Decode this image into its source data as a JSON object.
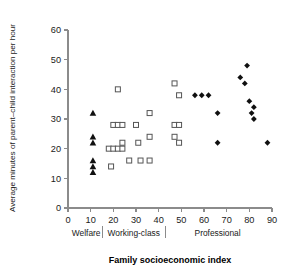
{
  "chart_data": {
    "type": "scatter",
    "title": "",
    "xlabel": "Family socioeconomic index",
    "ylabel": "Average minutes of parent–child interaction per hour",
    "xlim": [
      0,
      90
    ],
    "ylim": [
      0,
      60
    ],
    "xticks": [
      0,
      10,
      20,
      30,
      40,
      50,
      60,
      70,
      80,
      90
    ],
    "yticks": [
      0,
      10,
      20,
      30,
      40,
      50,
      60
    ],
    "xtick_labels": [
      "0",
      "10",
      "20",
      "30",
      "40",
      "50",
      "60",
      "70",
      "80",
      "90"
    ],
    "ytick_labels": [
      "0",
      "10",
      "20",
      "30",
      "40",
      "50",
      "60"
    ],
    "grid": false,
    "legend": "none",
    "category_bands": [
      {
        "label": "Welfare",
        "x_start": 0,
        "x_end": 15,
        "label_x": 8
      },
      {
        "label": "Working-class",
        "x_start": 15,
        "x_end": 43,
        "label_x": 29
      },
      {
        "label": "Professional",
        "x_start": 43,
        "x_end": 90,
        "label_x": 66
      }
    ],
    "band_separators": [
      15,
      43
    ],
    "series": [
      {
        "name": "Welfare",
        "marker": "triangle",
        "filled": true,
        "color": "#101010",
        "points": [
          {
            "x": 11,
            "y": 32
          },
          {
            "x": 11,
            "y": 24
          },
          {
            "x": 11,
            "y": 22
          },
          {
            "x": 11,
            "y": 16
          },
          {
            "x": 11,
            "y": 14
          },
          {
            "x": 11,
            "y": 12
          }
        ]
      },
      {
        "name": "Working-class",
        "marker": "square",
        "filled": false,
        "color": "#555555",
        "points": [
          {
            "x": 18,
            "y": 20
          },
          {
            "x": 19,
            "y": 14
          },
          {
            "x": 20,
            "y": 28
          },
          {
            "x": 20,
            "y": 20
          },
          {
            "x": 22,
            "y": 40
          },
          {
            "x": 22,
            "y": 28
          },
          {
            "x": 22,
            "y": 20
          },
          {
            "x": 24,
            "y": 28
          },
          {
            "x": 24,
            "y": 22
          },
          {
            "x": 24,
            "y": 20
          },
          {
            "x": 27,
            "y": 16
          },
          {
            "x": 30,
            "y": 28
          },
          {
            "x": 31,
            "y": 22
          },
          {
            "x": 32,
            "y": 16
          },
          {
            "x": 36,
            "y": 32
          },
          {
            "x": 36,
            "y": 24
          },
          {
            "x": 36,
            "y": 16
          },
          {
            "x": 47,
            "y": 42
          },
          {
            "x": 47,
            "y": 28
          },
          {
            "x": 47,
            "y": 24
          },
          {
            "x": 49,
            "y": 38
          },
          {
            "x": 49,
            "y": 28
          },
          {
            "x": 49,
            "y": 22
          }
        ]
      },
      {
        "name": "Professional",
        "marker": "diamond",
        "filled": true,
        "color": "#101010",
        "points": [
          {
            "x": 56,
            "y": 38
          },
          {
            "x": 59,
            "y": 38
          },
          {
            "x": 62,
            "y": 38
          },
          {
            "x": 66,
            "y": 32
          },
          {
            "x": 66,
            "y": 22
          },
          {
            "x": 76,
            "y": 44
          },
          {
            "x": 78,
            "y": 42
          },
          {
            "x": 79,
            "y": 48
          },
          {
            "x": 80,
            "y": 36
          },
          {
            "x": 81,
            "y": 32
          },
          {
            "x": 82,
            "y": 34
          },
          {
            "x": 82,
            "y": 30
          },
          {
            "x": 88,
            "y": 22
          }
        ]
      }
    ]
  }
}
